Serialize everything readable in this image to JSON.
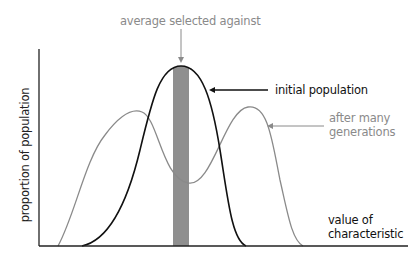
{
  "diagram": {
    "annotations": {
      "top": "average selected against",
      "initial": "initial population",
      "after_line1": "after many",
      "after_line2": "generations"
    },
    "axes": {
      "ylabel": "proportion of population",
      "xlabel_line1": "value of",
      "xlabel_line2": "characteristic"
    },
    "colors": {
      "initial_curve": "#111111",
      "after_curve": "#8a8a8a",
      "selected_bar": "#8f8f8f",
      "axis": "#222222",
      "gray_text": "#8a8a8a"
    },
    "series": [
      {
        "name": "initial population",
        "shape": "single peak (unimodal)",
        "peak_x": 181
      },
      {
        "name": "after many generations",
        "shape": "two peaks (bimodal)",
        "peaks_x": [
          142,
          248
        ]
      }
    ],
    "selected_region": {
      "label": "average selected against",
      "x_start": 173,
      "x_end": 189
    }
  }
}
